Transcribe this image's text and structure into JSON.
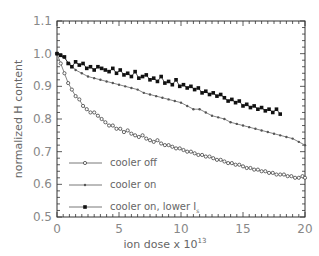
{
  "chart_data": {
    "type": "line",
    "title": "",
    "xlabel": "ion dose x 10",
    "xlabel_exponent": "13",
    "ylabel": "normalized H content",
    "xlim": [
      0,
      20
    ],
    "ylim": [
      0.5,
      1.1
    ],
    "xticks": [
      "0",
      "5",
      "10",
      "15",
      "20"
    ],
    "yticks": [
      "0.5",
      "0.6",
      "0.7",
      "0.8",
      "0.9",
      "1.0",
      "1.1"
    ],
    "grid": false,
    "legend_position": "bottom-left",
    "series": [
      {
        "name": "cooler off",
        "marker": "open-circle",
        "x": [
          0,
          0.3,
          0.6,
          0.9,
          1.2,
          1.5,
          1.8,
          2.1,
          2.4,
          2.7,
          3.0,
          3.3,
          3.6,
          3.9,
          4.2,
          4.5,
          4.8,
          5.1,
          5.4,
          5.7,
          6.0,
          6.3,
          6.6,
          6.9,
          7.2,
          7.5,
          7.8,
          8.1,
          8.4,
          8.7,
          9.0,
          9.3,
          9.6,
          9.9,
          10.2,
          10.5,
          10.8,
          11.1,
          11.4,
          11.7,
          12.0,
          12.3,
          12.6,
          12.9,
          13.2,
          13.5,
          13.8,
          14.1,
          14.4,
          14.7,
          15.0,
          15.3,
          15.6,
          15.9,
          16.2,
          16.5,
          16.8,
          17.1,
          17.4,
          17.7,
          18.0,
          18.3,
          18.6,
          18.9,
          19.2,
          19.5,
          19.8,
          20.0
        ],
        "y": [
          1.0,
          0.97,
          0.94,
          0.91,
          0.89,
          0.87,
          0.86,
          0.84,
          0.83,
          0.82,
          0.82,
          0.81,
          0.8,
          0.79,
          0.78,
          0.78,
          0.77,
          0.77,
          0.76,
          0.765,
          0.755,
          0.75,
          0.745,
          0.75,
          0.74,
          0.735,
          0.73,
          0.735,
          0.725,
          0.72,
          0.72,
          0.715,
          0.71,
          0.71,
          0.705,
          0.7,
          0.7,
          0.695,
          0.69,
          0.69,
          0.685,
          0.685,
          0.68,
          0.675,
          0.675,
          0.67,
          0.665,
          0.665,
          0.66,
          0.66,
          0.655,
          0.65,
          0.65,
          0.645,
          0.645,
          0.64,
          0.64,
          0.635,
          0.635,
          0.63,
          0.63,
          0.63,
          0.625,
          0.625,
          0.62,
          0.62,
          0.625,
          0.62
        ]
      },
      {
        "name": "cooler on",
        "marker": "small-dot",
        "x": [
          0,
          0.5,
          1.0,
          1.5,
          2.0,
          2.5,
          3.0,
          3.5,
          4.0,
          4.5,
          5.0,
          5.5,
          6.0,
          6.5,
          7.0,
          7.5,
          8.0,
          8.5,
          9.0,
          9.5,
          10.0,
          10.5,
          11.0,
          11.5,
          12.0,
          12.5,
          13.0,
          13.5,
          14.0,
          14.5,
          15.0,
          15.5,
          16.0,
          16.5,
          17.0,
          17.5,
          18.0,
          18.5,
          19.0,
          19.5,
          20.0
        ],
        "y": [
          1.0,
          0.99,
          0.97,
          0.95,
          0.94,
          0.93,
          0.925,
          0.92,
          0.915,
          0.91,
          0.905,
          0.9,
          0.895,
          0.89,
          0.88,
          0.875,
          0.87,
          0.865,
          0.86,
          0.855,
          0.85,
          0.84,
          0.83,
          0.83,
          0.82,
          0.81,
          0.805,
          0.8,
          0.79,
          0.785,
          0.78,
          0.775,
          0.77,
          0.765,
          0.76,
          0.755,
          0.75,
          0.745,
          0.74,
          0.73,
          0.72
        ]
      },
      {
        "name": "cooler on, lower I",
        "name_subscript": "s",
        "marker": "filled-square",
        "x": [
          0,
          0.3,
          0.6,
          0.9,
          1.2,
          1.5,
          1.8,
          2.1,
          2.4,
          2.7,
          3.0,
          3.3,
          3.6,
          3.9,
          4.2,
          4.5,
          4.8,
          5.1,
          5.4,
          5.7,
          6.0,
          6.3,
          6.6,
          6.9,
          7.2,
          7.5,
          7.8,
          8.1,
          8.4,
          8.7,
          9.0,
          9.3,
          9.6,
          9.9,
          10.2,
          10.5,
          10.8,
          11.1,
          11.4,
          11.7,
          12.0,
          12.3,
          12.6,
          12.9,
          13.2,
          13.5,
          13.8,
          14.1,
          14.4,
          14.7,
          15.0,
          15.3,
          15.6,
          15.9,
          16.2,
          16.5,
          16.8,
          17.1,
          17.4,
          17.7,
          18.0
        ],
        "y": [
          1.0,
          0.995,
          0.99,
          0.97,
          0.96,
          0.975,
          0.965,
          0.97,
          0.955,
          0.96,
          0.95,
          0.96,
          0.955,
          0.95,
          0.945,
          0.955,
          0.94,
          0.95,
          0.935,
          0.94,
          0.93,
          0.945,
          0.925,
          0.93,
          0.935,
          0.92,
          0.925,
          0.915,
          0.93,
          0.91,
          0.915,
          0.905,
          0.92,
          0.9,
          0.905,
          0.895,
          0.9,
          0.89,
          0.895,
          0.88,
          0.885,
          0.875,
          0.88,
          0.87,
          0.875,
          0.865,
          0.855,
          0.86,
          0.85,
          0.855,
          0.84,
          0.845,
          0.835,
          0.84,
          0.83,
          0.835,
          0.825,
          0.83,
          0.82,
          0.83,
          0.815
        ]
      }
    ]
  }
}
